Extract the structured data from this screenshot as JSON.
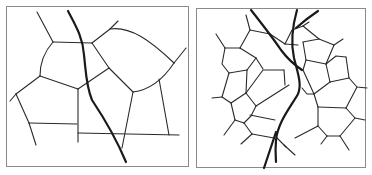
{
  "figure": {
    "panels": [
      {
        "id": "left",
        "label": "coarse network",
        "frame": {
          "x": 6,
          "y": 6,
          "w": 183,
          "h": 160
        },
        "edge_color": "#2a2a2a",
        "road_color": "#1a1a1a"
      },
      {
        "id": "right",
        "label": "dense network",
        "frame": {
          "x": 196,
          "y": 8,
          "w": 170,
          "h": 160
        },
        "edge_color": "#2a2a2a",
        "road_color": "#1a1a1a"
      }
    ]
  }
}
